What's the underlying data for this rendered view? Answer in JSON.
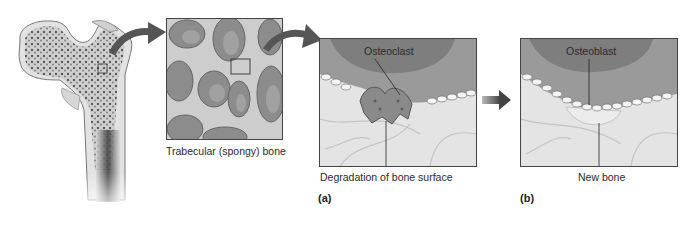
{
  "figure": {
    "femur": {
      "label": "Femur (proximal, sectioned)"
    },
    "trabecular": {
      "caption": "Trabecular (spongy) bone"
    },
    "panel_a": {
      "letter": "(a)",
      "cell_label": "Osteoclast",
      "caption": "Degradation of bone surface"
    },
    "panel_b": {
      "letter": "(b)",
      "cell_label": "Osteoblast",
      "caption": "New bone"
    },
    "colors": {
      "arrow": "#555555",
      "bone_gray": "#8a8a8a",
      "matrix": "#e6e6e6",
      "border": "#444444"
    }
  }
}
